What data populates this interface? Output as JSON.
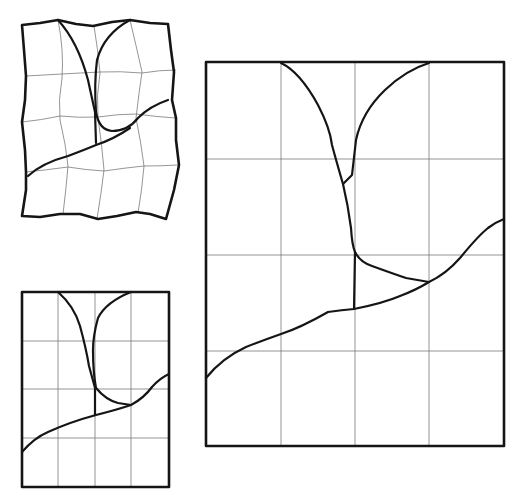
{
  "figure": {
    "panels": [
      {
        "id": "distorted",
        "label": "Distorted grid copy",
        "rows": 4,
        "cols": 4
      },
      {
        "id": "small",
        "label": "Small original grid",
        "rows": 4,
        "cols": 4
      },
      {
        "id": "large",
        "label": "Enlarged grid copy",
        "rows": 4,
        "cols": 4
      }
    ],
    "colors": {
      "ink": "#151515",
      "grid": "#7a7a7a",
      "background": "#ffffff"
    }
  },
  "caption": ""
}
